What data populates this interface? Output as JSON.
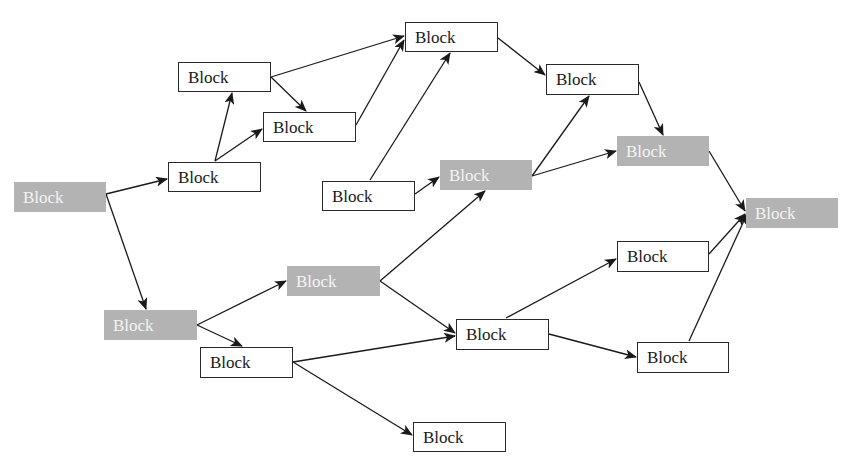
{
  "diagram": {
    "type": "directed-graph",
    "colors": {
      "shaded_fill": "#b3b3b3",
      "shaded_text": "#f4f4f4",
      "plain_border": "#2a2a2a",
      "edge": "#1a1a1a"
    },
    "nodes": [
      {
        "id": "b1",
        "label": "Block",
        "style": "shaded",
        "x": 14,
        "y": 182,
        "w": 92,
        "h": 30
      },
      {
        "id": "b2",
        "label": "Block",
        "style": "plain",
        "x": 178,
        "y": 62,
        "w": 93,
        "h": 30
      },
      {
        "id": "b3",
        "label": "Block",
        "style": "plain",
        "x": 263,
        "y": 112,
        "w": 93,
        "h": 30
      },
      {
        "id": "b4",
        "label": "Block",
        "style": "plain",
        "x": 168,
        "y": 162,
        "w": 93,
        "h": 30
      },
      {
        "id": "b5",
        "label": "Block",
        "style": "plain",
        "x": 405,
        "y": 22,
        "w": 93,
        "h": 30
      },
      {
        "id": "b6",
        "label": "Block",
        "style": "plain",
        "x": 322,
        "y": 181,
        "w": 93,
        "h": 30
      },
      {
        "id": "b7",
        "label": "Block",
        "style": "shaded",
        "x": 440,
        "y": 160,
        "w": 92,
        "h": 30
      },
      {
        "id": "b8",
        "label": "Block",
        "style": "plain",
        "x": 546,
        "y": 64,
        "w": 93,
        "h": 31
      },
      {
        "id": "b9",
        "label": "Block",
        "style": "shaded",
        "x": 617,
        "y": 136,
        "w": 92,
        "h": 30
      },
      {
        "id": "b10",
        "label": "Block",
        "style": "shaded",
        "x": 746,
        "y": 198,
        "w": 92,
        "h": 30
      },
      {
        "id": "b11",
        "label": "Block",
        "style": "shaded",
        "x": 287,
        "y": 266,
        "w": 93,
        "h": 30
      },
      {
        "id": "b12",
        "label": "Block",
        "style": "shaded",
        "x": 104,
        "y": 310,
        "w": 93,
        "h": 30
      },
      {
        "id": "b13",
        "label": "Block",
        "style": "plain",
        "x": 200,
        "y": 347,
        "w": 93,
        "h": 31
      },
      {
        "id": "b14",
        "label": "Block",
        "style": "plain",
        "x": 456,
        "y": 319,
        "w": 93,
        "h": 31
      },
      {
        "id": "b15",
        "label": "Block",
        "style": "plain",
        "x": 617,
        "y": 241,
        "w": 92,
        "h": 31
      },
      {
        "id": "b16",
        "label": "Block",
        "style": "plain",
        "x": 637,
        "y": 342,
        "w": 92,
        "h": 31
      },
      {
        "id": "b17",
        "label": "Block",
        "style": "plain",
        "x": 413,
        "y": 422,
        "w": 93,
        "h": 30
      }
    ],
    "edges": [
      {
        "from": "b1",
        "to": "b4",
        "x1": 106,
        "y1": 194,
        "x2": 167,
        "y2": 179
      },
      {
        "from": "b1",
        "to": "b12",
        "x1": 106,
        "y1": 194,
        "x2": 146,
        "y2": 309
      },
      {
        "from": "b4",
        "to": "b2",
        "x1": 215,
        "y1": 161,
        "x2": 232,
        "y2": 93
      },
      {
        "from": "b4",
        "to": "b3",
        "x1": 215,
        "y1": 161,
        "x2": 262,
        "y2": 129
      },
      {
        "from": "b2",
        "to": "b3",
        "x1": 271,
        "y1": 77,
        "x2": 306,
        "y2": 111
      },
      {
        "from": "b2",
        "to": "b5",
        "x1": 271,
        "y1": 77,
        "x2": 404,
        "y2": 36
      },
      {
        "from": "b3",
        "to": "b5",
        "x1": 356,
        "y1": 125,
        "x2": 404,
        "y2": 40
      },
      {
        "from": "b6",
        "to": "b5",
        "x1": 370,
        "y1": 180,
        "x2": 450,
        "y2": 53
      },
      {
        "from": "b6",
        "to": "b7",
        "x1": 415,
        "y1": 194,
        "x2": 439,
        "y2": 177
      },
      {
        "from": "b5",
        "to": "b8",
        "x1": 498,
        "y1": 38,
        "x2": 545,
        "y2": 75
      },
      {
        "from": "b7",
        "to": "b8",
        "x1": 532,
        "y1": 176,
        "x2": 589,
        "y2": 96
      },
      {
        "from": "b7",
        "to": "b9",
        "x1": 532,
        "y1": 176,
        "x2": 616,
        "y2": 151
      },
      {
        "from": "b8",
        "to": "b9",
        "x1": 639,
        "y1": 82,
        "x2": 663,
        "y2": 135
      },
      {
        "from": "b9",
        "to": "b10",
        "x1": 709,
        "y1": 151,
        "x2": 745,
        "y2": 211
      },
      {
        "from": "b15",
        "to": "b10",
        "x1": 709,
        "y1": 254,
        "x2": 745,
        "y2": 214
      },
      {
        "from": "b16",
        "to": "b10",
        "x1": 689,
        "y1": 341,
        "x2": 747,
        "y2": 214
      },
      {
        "from": "b12",
        "to": "b11",
        "x1": 197,
        "y1": 325,
        "x2": 286,
        "y2": 281
      },
      {
        "from": "b12",
        "to": "b13",
        "x1": 197,
        "y1": 325,
        "x2": 242,
        "y2": 346
      },
      {
        "from": "b11",
        "to": "b7",
        "x1": 380,
        "y1": 281,
        "x2": 485,
        "y2": 191
      },
      {
        "from": "b11",
        "to": "b14",
        "x1": 380,
        "y1": 281,
        "x2": 455,
        "y2": 333
      },
      {
        "from": "b13",
        "to": "b14",
        "x1": 293,
        "y1": 362,
        "x2": 455,
        "y2": 336
      },
      {
        "from": "b13",
        "to": "b17",
        "x1": 293,
        "y1": 362,
        "x2": 412,
        "y2": 435
      },
      {
        "from": "b14",
        "to": "b15",
        "x1": 506,
        "y1": 318,
        "x2": 616,
        "y2": 259
      },
      {
        "from": "b14",
        "to": "b16",
        "x1": 549,
        "y1": 334,
        "x2": 636,
        "y2": 357
      }
    ]
  }
}
